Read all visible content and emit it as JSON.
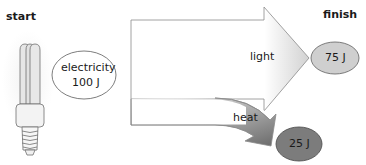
{
  "labels": {
    "start": "start",
    "finish": "finish"
  },
  "input": {
    "name": "electricity",
    "value": "100 J"
  },
  "outputs": [
    {
      "name": "light",
      "value": "75 J",
      "color": "#cfcfcf"
    },
    {
      "name": "heat",
      "value": "25 J",
      "color": "#7a7a7a"
    }
  ],
  "colors": {
    "light_arrow_start": "#ffffff",
    "light_arrow_end": "#d4d4d4",
    "heat_arrow_start": "#f0f0f0",
    "heat_arrow_end": "#6a6a6a",
    "outline": "#808080"
  }
}
